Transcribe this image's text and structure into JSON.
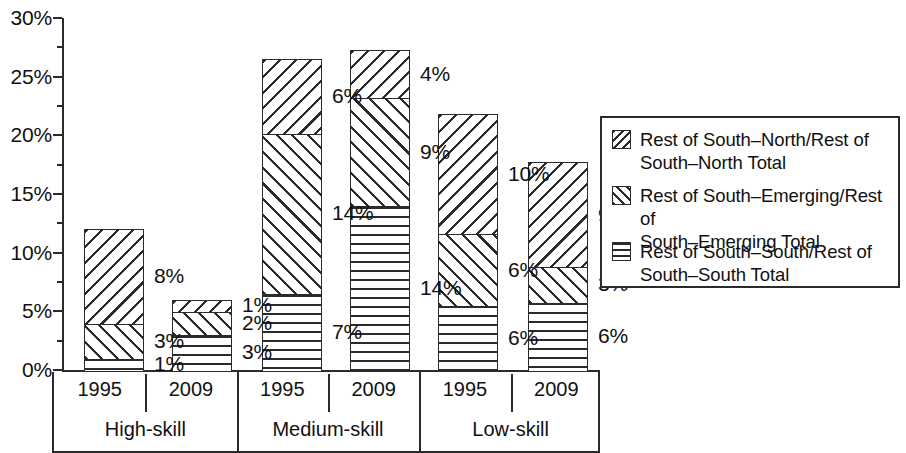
{
  "chart_data": {
    "type": "bar",
    "subtype": "stacked-bar-grouped",
    "title": "",
    "xlabel": "",
    "ylabel": "",
    "ylim": [
      0,
      30
    ],
    "y_unit": "%",
    "grid": false,
    "legend_position": "right",
    "y_ticks": [
      "0%",
      "5%",
      "10%",
      "15%",
      "20%",
      "25%",
      "30%"
    ],
    "y_tick_values": [
      0,
      5,
      10,
      15,
      20,
      25,
      30
    ],
    "y_minor_tick_values": [
      2.5,
      7.5,
      12.5,
      17.5,
      22.5,
      27.5
    ],
    "groups": [
      "High-skill",
      "Medium-skill",
      "Low-skill"
    ],
    "categories": [
      "1995",
      "2009",
      "1995",
      "2009",
      "1995",
      "2009"
    ],
    "series": [
      {
        "name": "Rest of South–South/Rest of South–South Total",
        "pattern": "horizontal-lines",
        "values": [
          1,
          3,
          7,
          14,
          6,
          6
        ],
        "labels": [
          "1%",
          "3%",
          "7%",
          "14%",
          "6%",
          "6%"
        ]
      },
      {
        "name": "Rest of South–Emerging/Rest of South–Emerging Total",
        "pattern": "forward-diagonal",
        "values": [
          3,
          2,
          14,
          9,
          6,
          3
        ],
        "labels": [
          "3%",
          "2%",
          "14%",
          "9%",
          "6%",
          "3%"
        ]
      },
      {
        "name": "Rest of South–North/Rest of South–North Total",
        "pattern": "backward-diagonal",
        "values": [
          8,
          1,
          6,
          4,
          10,
          9
        ],
        "labels": [
          "8%",
          "1%",
          "6%",
          "4%",
          "10%",
          "9%"
        ]
      }
    ],
    "totals": [
      12,
      6,
      26.5,
      27.3,
      21.8,
      17.7
    ],
    "colors": {
      "ink": "#2b2b2b",
      "background": "#ffffff"
    }
  },
  "bars": [
    {
      "id": "high-1995",
      "group": "High-skill",
      "year": "1995",
      "left": 84,
      "width": 60,
      "total": 12,
      "segments": [
        {
          "series": "south",
          "value": 1,
          "label": "1%",
          "label_dy": 0,
          "pattern": "pat-south"
        },
        {
          "series": "emerging",
          "value": 3,
          "label": "3%",
          "label_dy": 0,
          "pattern": "pat-emerging"
        },
        {
          "series": "north",
          "value": 8,
          "label": "8%",
          "label_dy": 0,
          "pattern": "pat-north"
        }
      ]
    },
    {
      "id": "high-2009",
      "group": "High-skill",
      "year": "2009",
      "left": 172,
      "width": 60,
      "total": 6,
      "segments": [
        {
          "series": "south",
          "value": 3,
          "label": "3%",
          "label_dy": 0,
          "pattern": "pat-south"
        },
        {
          "series": "emerging",
          "value": 2,
          "label": "2%",
          "label_dy": 0,
          "pattern": "pat-emerging"
        },
        {
          "series": "north",
          "value": 1,
          "label": "1%",
          "label_dy": 0,
          "pattern": "pat-north"
        }
      ]
    },
    {
      "id": "medium-1995",
      "group": "Medium-skill",
      "year": "1995",
      "left": 262,
      "width": 60,
      "total": 26.5,
      "segments": [
        {
          "series": "south",
          "value": 6.5,
          "label": "7%",
          "label_dy": 0,
          "pattern": "pat-south"
        },
        {
          "series": "emerging",
          "value": 13.7,
          "label": "14%",
          "label_dy": 0,
          "pattern": "pat-emerging"
        },
        {
          "series": "north",
          "value": 6.3,
          "label": "6%",
          "label_dy": 0,
          "pattern": "pat-north"
        }
      ]
    },
    {
      "id": "medium-2009",
      "group": "Medium-skill",
      "year": "2009",
      "left": 350,
      "width": 60,
      "total": 27.3,
      "segments": [
        {
          "series": "south",
          "value": 14.0,
          "label": "14%",
          "label_dy": 0,
          "pattern": "pat-south"
        },
        {
          "series": "emerging",
          "value": 9.2,
          "label": "9%",
          "label_dy": 0,
          "pattern": "pat-emerging"
        },
        {
          "series": "north",
          "value": 4.1,
          "label": "4%",
          "label_dy": 0,
          "pattern": "pat-north"
        }
      ]
    },
    {
      "id": "low-1995",
      "group": "Low-skill",
      "year": "1995",
      "left": 438,
      "width": 60,
      "total": 21.8,
      "segments": [
        {
          "series": "south",
          "value": 5.5,
          "label": "6%",
          "label_dy": 0,
          "pattern": "pat-south"
        },
        {
          "series": "emerging",
          "value": 6.1,
          "label": "6%",
          "label_dy": 0,
          "pattern": "pat-emerging"
        },
        {
          "series": "north",
          "value": 10.2,
          "label": "10%",
          "label_dy": 0,
          "pattern": "pat-north"
        }
      ]
    },
    {
      "id": "low-2009",
      "group": "Low-skill",
      "year": "2009",
      "left": 528,
      "width": 60,
      "total": 17.7,
      "segments": [
        {
          "series": "south",
          "value": 5.8,
          "label": "6%",
          "label_dy": 0,
          "pattern": "pat-south"
        },
        {
          "series": "emerging",
          "value": 3.0,
          "label": "3%",
          "label_dy": 0,
          "pattern": "pat-emerging"
        },
        {
          "series": "north",
          "value": 8.9,
          "label": "9%",
          "label_dy": 0,
          "pattern": "pat-north"
        }
      ]
    }
  ],
  "x_axis": {
    "years": [
      "1995",
      "2009",
      "1995",
      "2009",
      "1995",
      "2009"
    ],
    "groups": [
      "High-skill",
      "Medium-skill",
      "Low-skill"
    ]
  },
  "legend": {
    "items": [
      {
        "swatch": "leg-sw-north",
        "line1": "Rest of South–North/Rest of",
        "line2": "South–North Total"
      },
      {
        "swatch": "leg-sw-emerging",
        "line1": "Rest of South–Emerging/Rest of",
        "line2": "South–Emerging Total"
      },
      {
        "swatch": "leg-sw-south",
        "line1": "Rest of South–South/Rest of",
        "line2": "South–South Total"
      }
    ]
  }
}
